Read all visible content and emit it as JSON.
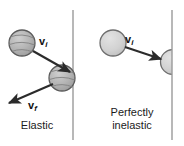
{
  "figure": {
    "width": 184,
    "height": 146,
    "background": "#ffffff"
  },
  "colors": {
    "wall": "#9a9a9a",
    "arrow": "#2b2b2b",
    "ball_textured_fill": "#b5b5b5",
    "ball_textured_stroke": "#5c5c5c",
    "ball_plain_fill": "#d2d2d2",
    "ball_plain_stroke": "#6e6e6e",
    "text": "#1b1b1b"
  },
  "panels": [
    {
      "id": "elastic",
      "label": "Elastic",
      "wall_x": 73,
      "balls": [
        {
          "id": "incoming-ball",
          "cx": 22,
          "cy": 43,
          "r": 13,
          "style": "textured"
        },
        {
          "id": "contact-ball",
          "cx": 63,
          "cy": 78,
          "r": 13,
          "style": "textured"
        }
      ],
      "vectors": [
        {
          "id": "v-initial",
          "label": "v",
          "subscript": "i",
          "x1": 32,
          "y1": 50,
          "x2": 70,
          "y2": 72
        },
        {
          "id": "v-final",
          "label": "v",
          "subscript": "f",
          "x1": 52,
          "y1": 84,
          "x2": 8,
          "y2": 103
        }
      ]
    },
    {
      "id": "perfectly-inelastic",
      "label": "Perfectly\ninelastic",
      "wall_x": 172,
      "balls": [
        {
          "id": "incoming-ball",
          "cx": 113,
          "cy": 43,
          "r": 13,
          "style": "plain"
        },
        {
          "id": "stuck-ball",
          "cx": 172,
          "cy": 62,
          "r": 12,
          "style": "plain-clipped"
        }
      ],
      "vectors": [
        {
          "id": "v-initial",
          "label": "v",
          "subscript": "i",
          "x1": 124,
          "y1": 47,
          "x2": 160,
          "y2": 59
        }
      ]
    }
  ],
  "labels": {
    "elastic": "Elastic",
    "perfectly_inelastic": "Perfectly\ninelastic",
    "v_initial": "v",
    "v_initial_sub": "i",
    "v_final": "v",
    "v_final_sub": "f"
  }
}
